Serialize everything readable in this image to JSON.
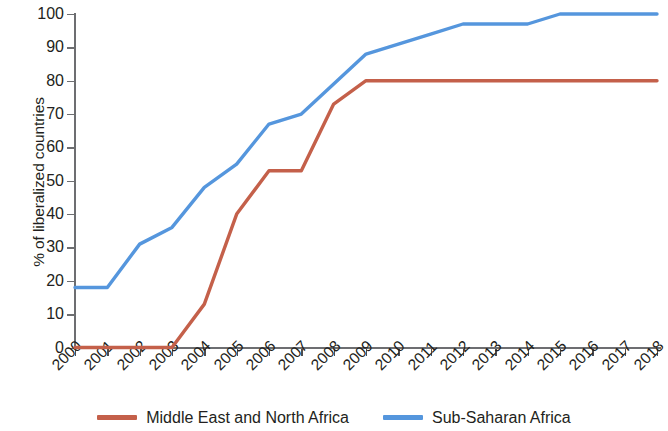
{
  "chart_data": {
    "type": "line",
    "title": "",
    "xlabel": "",
    "ylabel": "% of liberalized countries",
    "x": [
      2000,
      2001,
      2002,
      2003,
      2004,
      2005,
      2006,
      2007,
      2008,
      2009,
      2010,
      2011,
      2012,
      2013,
      2014,
      2015,
      2016,
      2017,
      2018
    ],
    "categories": [
      "2000",
      "2001",
      "2002",
      "2003",
      "2004",
      "2005",
      "2006",
      "2007",
      "2008",
      "2009",
      "2010",
      "2011",
      "2012",
      "2013",
      "2014",
      "2015",
      "2016",
      "2017",
      "2018"
    ],
    "series": [
      {
        "name": "Middle East and North Africa",
        "color": "#c4604a",
        "values": [
          0,
          0,
          0,
          0,
          13,
          40,
          53,
          53,
          73,
          80,
          80,
          80,
          80,
          80,
          80,
          80,
          80,
          80,
          80
        ]
      },
      {
        "name": "Sub-Saharan Africa",
        "color": "#5596dd",
        "values": [
          18,
          18,
          31,
          36,
          48,
          55,
          67,
          70,
          79,
          88,
          91,
          94,
          97,
          97,
          97,
          100,
          100,
          100,
          100
        ]
      }
    ],
    "ylim": [
      0,
      100
    ],
    "ytick_labels": [
      "0",
      "10",
      "20",
      "30",
      "40",
      "50",
      "60",
      "70",
      "80",
      "90",
      "100"
    ],
    "yticks": [
      0,
      10,
      20,
      30,
      40,
      50,
      60,
      70,
      80,
      90,
      100
    ],
    "grid": false,
    "legend_position": "bottom"
  },
  "legend": {
    "entries": [
      {
        "label": "Middle East and North Africa",
        "color": "#c4604a"
      },
      {
        "label": "Sub-Saharan Africa",
        "color": "#5596dd"
      }
    ]
  }
}
